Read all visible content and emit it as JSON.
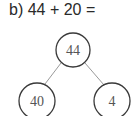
{
  "question": {
    "label": "b) 44 + 20 ="
  },
  "tree": {
    "root": {
      "value": "44"
    },
    "left": {
      "value": "40"
    },
    "right": {
      "value": "4"
    }
  },
  "colors": {
    "stroke": "#3a3a3a",
    "line": "#9a9a9a",
    "text": "#555555"
  }
}
